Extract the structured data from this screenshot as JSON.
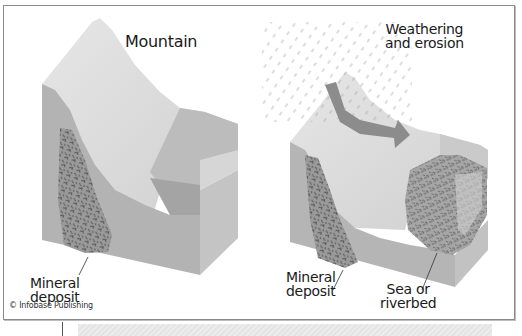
{
  "figure": {
    "left_panel": {
      "title": "Mountain",
      "callout": "Mineral\ndeposit",
      "callout_line1": "Mineral",
      "callout_line2": "deposit"
    },
    "right_panel": {
      "title_line1": "Weathering",
      "title_line2": "and erosion",
      "callout_left_line1": "Mineral",
      "callout_left_line2": "deposit",
      "callout_right_line1": "Sea or",
      "callout_right_line2": "riverbed"
    },
    "credit": "© Infobase Publishing",
    "icons": [
      "rain-streaks-icon",
      "erosion-arrow-icon",
      "mineral-texture-pattern"
    ],
    "colors": {
      "top_surface": "#dcdcdc",
      "front_face": "#b4b4b4",
      "side_face": "#c8c8c8",
      "valley": "#a9a9a9",
      "deposit": "#8e8e8e",
      "arrow": "#8c8c8c",
      "border": "#8a8a8a"
    }
  }
}
